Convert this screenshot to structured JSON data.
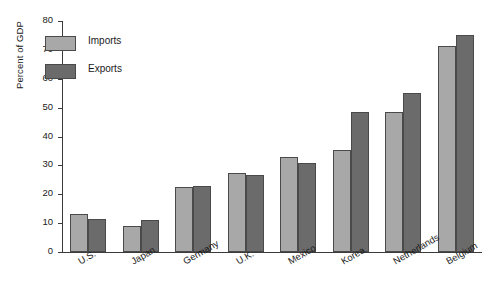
{
  "chart_data": {
    "type": "bar",
    "title": "",
    "xlabel": "",
    "ylabel": "Percent of GDP",
    "categories": [
      "U.S.",
      "Japan",
      "Germany",
      "U.K.",
      "Mexico",
      "Korea",
      "Netherlands",
      "Belgium"
    ],
    "series": [
      {
        "name": "Imports",
        "color": "#a8a8a8",
        "values": [
          13,
          9,
          22.5,
          27.5,
          33,
          35.5,
          48.5,
          71.5
        ]
      },
      {
        "name": "Exports",
        "color": "#6b6b6b",
        "values": [
          11.5,
          11,
          23,
          26.5,
          31,
          48.5,
          55,
          75
        ]
      }
    ],
    "ylim": [
      0,
      80
    ],
    "ytick_values": [
      0,
      10,
      20,
      30,
      40,
      50,
      60,
      70,
      80
    ],
    "ytick_labels": [
      "0",
      "10",
      "20",
      "30",
      "40",
      "50",
      "60",
      "70",
      "80"
    ],
    "grid": false,
    "legend_position": "upper left inside",
    "xtick_rotation": -30
  },
  "legend": {
    "entries": [
      {
        "label": "Imports",
        "swatch": "imports"
      },
      {
        "label": "Exports",
        "swatch": "exports"
      }
    ]
  }
}
